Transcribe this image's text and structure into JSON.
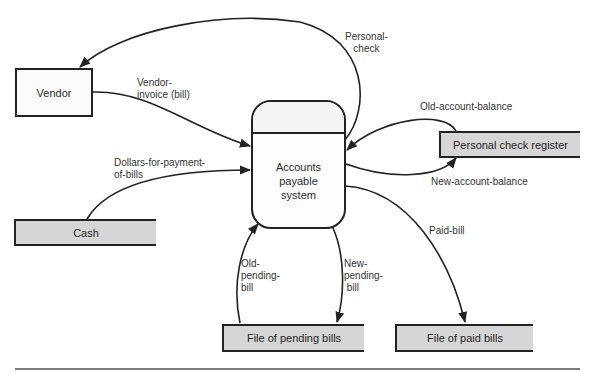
{
  "diagram": {
    "type": "data-flow-diagram",
    "process": {
      "label": "Accounts\npayable\nsystem",
      "line1": "Accounts",
      "line2": "payable",
      "line3": "system"
    },
    "external_entities": [
      {
        "id": "vendor",
        "label": "Vendor"
      }
    ],
    "data_stores": [
      {
        "id": "cash",
        "label": "Cash"
      },
      {
        "id": "personal-check-register",
        "label": "Personal check register"
      },
      {
        "id": "pending-bills",
        "label": "File of pending bills"
      },
      {
        "id": "paid-bills",
        "label": "File of paid bills"
      }
    ],
    "flows": [
      {
        "id": "vendor-invoice",
        "label": "Vendor-\ninvoice (bill)",
        "from": "Vendor",
        "to": "Accounts payable system"
      },
      {
        "id": "personal-check",
        "label": "Personal-\ncheck",
        "from": "Accounts payable system",
        "to": "Vendor"
      },
      {
        "id": "dollars",
        "label": "Dollars-for-payment-\nof-bills",
        "from": "Cash",
        "to": "Accounts payable system"
      },
      {
        "id": "old-account-balance",
        "label": "Old-account-balance",
        "from": "Personal check register",
        "to": "Accounts payable system"
      },
      {
        "id": "new-account-balance",
        "label": "New-account-balance",
        "from": "Accounts payable system",
        "to": "Personal check register"
      },
      {
        "id": "paid-bill",
        "label": "Paid-bill",
        "from": "Accounts payable system",
        "to": "File of paid bills"
      },
      {
        "id": "old-pending-bill",
        "label": "Old-\npending-\nbill",
        "from": "File of pending bills",
        "to": "Accounts payable system"
      },
      {
        "id": "new-pending-bill",
        "label": "New-\npending-\n bill",
        "from": "Accounts payable system",
        "to": "File of pending bills"
      }
    ]
  },
  "colors": {
    "line": "#222222",
    "store_fill": "#d6d6d6",
    "rule": "#7a7a7a"
  }
}
